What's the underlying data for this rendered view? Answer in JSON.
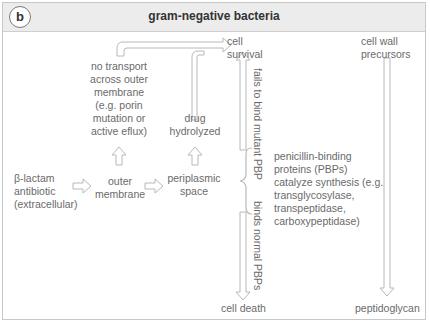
{
  "panel": {
    "badge": "b",
    "title": "gram-negative bacteria"
  },
  "nodes": {
    "antibiotic": [
      "β-lactam",
      "antibiotic",
      "(extracellular)"
    ],
    "outer_membrane": [
      "outer",
      "membrane"
    ],
    "periplasmic_space": [
      "periplasmic",
      "space"
    ],
    "no_transport": [
      "no transport",
      "across outer",
      "membrane",
      "(e.g. porin",
      "mutation or",
      "active eflux)"
    ],
    "drug_hydrolyzed": [
      "drug",
      "hydrolyzed"
    ],
    "cell_survival": [
      "cell",
      "survival"
    ],
    "cell_death": "cell death",
    "pbps": [
      "penicillin-binding",
      "proteins (PBPs)",
      "catalyze synthesis (e.g.",
      "transglycosylase,",
      "transpeptidase,",
      "carboxypeptidase)"
    ],
    "cell_wall_precursors": [
      "cell wall",
      "precursors"
    ],
    "peptidoglycan": "peptidoglycan"
  },
  "edge_labels": {
    "fails_to_bind": "fails to bind mutant PBP",
    "binds_normal": "binds normal PBPs"
  },
  "colors": {
    "header_bg": "#ececec",
    "border": "#c8c8c8",
    "arrow": "#b8b8b8",
    "text": "#6a6a6a"
  }
}
